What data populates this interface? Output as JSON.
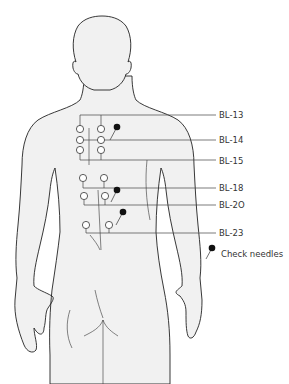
{
  "figure": {
    "colors": {
      "body_fill": "#f1f1f1",
      "outline": "#222222",
      "leader_line": "#444444",
      "needle_dot": "#111111",
      "open_point": "#ffffff"
    }
  },
  "labels": [
    {
      "id": "BL-13",
      "text": "BL-13",
      "y": 115
    },
    {
      "id": "BL-14",
      "text": "BL-14",
      "y": 140
    },
    {
      "id": "BL-15",
      "text": "BL-15",
      "y": 161
    },
    {
      "id": "BL-18",
      "text": "BL-18",
      "y": 188
    },
    {
      "id": "BL-20",
      "text": "BL-2O",
      "y": 205
    },
    {
      "id": "BL-23",
      "text": "BL-23",
      "y": 233
    }
  ],
  "legend": {
    "marker": "filled-needle-dot",
    "text": "Check needles"
  },
  "points": {
    "open": [
      {
        "x": 80,
        "y": 129
      },
      {
        "x": 101,
        "y": 129
      },
      {
        "x": 80,
        "y": 140
      },
      {
        "x": 101,
        "y": 140
      },
      {
        "x": 80,
        "y": 150
      },
      {
        "x": 101,
        "y": 150
      },
      {
        "x": 83,
        "y": 178
      },
      {
        "x": 104,
        "y": 178
      },
      {
        "x": 84,
        "y": 196
      },
      {
        "x": 105,
        "y": 196
      },
      {
        "x": 86,
        "y": 225
      },
      {
        "x": 109,
        "y": 225
      }
    ],
    "needles": [
      {
        "x": 117,
        "y": 127
      },
      {
        "x": 117,
        "y": 190
      },
      {
        "x": 123,
        "y": 212
      }
    ]
  }
}
